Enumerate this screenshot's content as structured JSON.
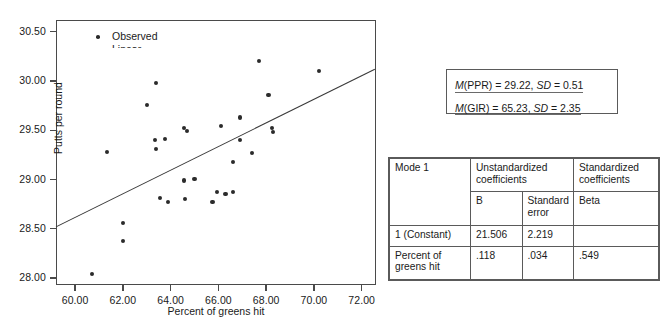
{
  "figure": {
    "name": "Scatterplot of putts per round versus percent of greens hit with linear fit"
  },
  "chart_data": {
    "type": "scatter",
    "title": "",
    "xlabel": "Percent of greens hit",
    "ylabel": "Putts per round",
    "xlim": [
      59.2,
      72.6
    ],
    "ylim": [
      27.93,
      30.62
    ],
    "xticks": [
      "60.00",
      "62.00",
      "64.00",
      "66.00",
      "68.00",
      "70.00",
      "72.00"
    ],
    "xtick_values": [
      60.0,
      62.0,
      64.0,
      66.0,
      68.0,
      70.0,
      72.0
    ],
    "yticks": [
      "28.00",
      "28.50",
      "29.00",
      "29.50",
      "30.00",
      "30.50"
    ],
    "ytick_values": [
      28.0,
      28.5,
      29.0,
      29.5,
      30.0,
      30.5
    ],
    "grid": false,
    "legend_position": "top-left",
    "legend": [
      {
        "label": "Observed",
        "marker": "dot"
      },
      {
        "label": "Linear",
        "marker": "line"
      }
    ],
    "series": [
      {
        "name": "Observed",
        "points": [
          [
            60.72,
            28.04
          ],
          [
            61.32,
            29.28
          ],
          [
            62.0,
            28.56
          ],
          [
            62.02,
            28.38
          ],
          [
            63.02,
            29.76
          ],
          [
            63.4,
            29.98
          ],
          [
            63.35,
            29.4
          ],
          [
            63.4,
            29.31
          ],
          [
            63.75,
            29.41
          ],
          [
            63.55,
            28.81
          ],
          [
            63.9,
            28.77
          ],
          [
            64.55,
            29.52
          ],
          [
            64.7,
            29.49
          ],
          [
            64.55,
            28.99
          ],
          [
            64.6,
            28.8
          ],
          [
            65.0,
            29.01
          ],
          [
            65.75,
            28.77
          ],
          [
            65.95,
            28.87
          ],
          [
            66.1,
            29.54
          ],
          [
            66.3,
            28.85
          ],
          [
            66.6,
            28.87
          ],
          [
            66.6,
            29.18
          ],
          [
            66.9,
            29.63
          ],
          [
            66.9,
            29.4
          ],
          [
            67.4,
            29.27
          ],
          [
            67.7,
            30.2
          ],
          [
            68.1,
            29.86
          ],
          [
            68.25,
            29.52
          ],
          [
            68.28,
            29.48
          ],
          [
            70.2,
            30.1
          ]
        ]
      }
    ],
    "fit_line": {
      "name": "Linear",
      "x0": 59.2,
      "y0": 28.52,
      "x1": 72.55,
      "y1": 30.12,
      "intercept": 21.506,
      "slope": 0.118
    }
  },
  "stats_box": {
    "lines": [
      {
        "stat": "M",
        "variable": "(PPR) = 29.22, ",
        "sd_label": "SD",
        "sd_value": " = 0.51"
      },
      {
        "stat": "M",
        "variable": "(GIR) = 65.23, ",
        "sd_label": "SD",
        "sd_value": " = 2.35"
      }
    ],
    "line1_text": "M(PPR) = 29.22, SD = 0.51",
    "line2_text": "M(GIR) = 65.23, SD = 2.35"
  },
  "coefficients_table": {
    "model_label": "Mode 1",
    "group_headers": {
      "unstandardized": "Unstandardized coefficients",
      "standardized": "Standardized coefficients"
    },
    "column_headers": {
      "b": "B",
      "standard_error": "Standard error",
      "beta": "Beta"
    },
    "rows": [
      {
        "label": "1 (Constant)",
        "b": "21.506",
        "standard_error": "2.219",
        "beta": ""
      },
      {
        "label": "Percent of greens hit",
        "b": ".118",
        "standard_error": ".034",
        "beta": ".549"
      }
    ]
  }
}
